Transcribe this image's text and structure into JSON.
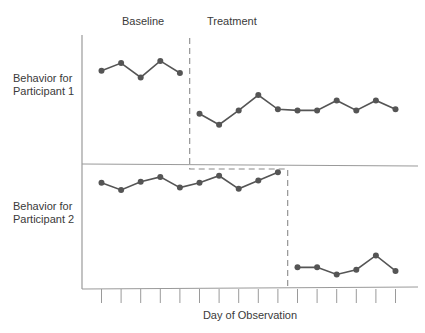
{
  "chart_data": {
    "type": "line",
    "title": "",
    "design": "multiple-baseline across participants",
    "xlabel": "Day of Observation",
    "ylabel": "",
    "x": [
      1,
      2,
      3,
      4,
      5,
      6,
      7,
      8,
      9,
      10,
      11,
      12,
      13,
      14,
      15,
      16
    ],
    "tick_count": 16,
    "tick_labels_shown": false,
    "grid": false,
    "legend": null,
    "phases": [
      {
        "label": "Baseline"
      },
      {
        "label": "Treatment"
      }
    ],
    "panels": [
      {
        "label_line1": "Behavior for",
        "label_line2": "Participant 1",
        "phase_change_after_day": 5,
        "series": [
          {
            "name": "Participant 1 - Baseline",
            "x": [
              1,
              2,
              3,
              4,
              5
            ],
            "values": [
              7.2,
              7.9,
              6.6,
              8.1,
              7.0
            ]
          },
          {
            "name": "Participant 1 - Treatment",
            "x": [
              6,
              7,
              8,
              9,
              10,
              11,
              12,
              13,
              14,
              15,
              16
            ],
            "values": [
              3.3,
              2.3,
              3.6,
              5.0,
              3.7,
              3.6,
              3.6,
              4.5,
              3.6,
              4.5,
              3.7
            ]
          }
        ]
      },
      {
        "label_line1": "Behavior for",
        "label_line2": "Participant 2",
        "phase_change_after_day": 10,
        "series": [
          {
            "name": "Participant 2 - Baseline",
            "x": [
              1,
              2,
              3,
              4,
              5,
              6,
              7,
              8,
              9,
              10
            ],
            "values": [
              8.5,
              7.9,
              8.6,
              9.0,
              8.1,
              8.5,
              9.1,
              8.0,
              8.7,
              9.4
            ]
          },
          {
            "name": "Participant 2 - Treatment",
            "x": [
              11,
              12,
              13,
              14,
              15,
              16
            ],
            "values": [
              1.4,
              1.4,
              0.8,
              1.2,
              2.4,
              1.1
            ]
          }
        ]
      }
    ]
  },
  "labels": {
    "baseline": "Baseline",
    "treatment": "Treatment",
    "p1_line1": "Behavior for",
    "p1_line2": "Participant 1",
    "p2_line1": "Behavior for",
    "p2_line2": "Participant 2",
    "xlabel": "Day of Observation"
  },
  "colors": {
    "axis": "#9a9a9a",
    "line": "#555555",
    "marker": "#555555",
    "dashed": "#8a8a8a"
  }
}
